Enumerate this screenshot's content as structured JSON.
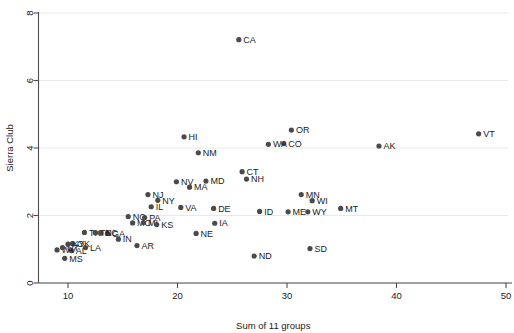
{
  "chart_data": {
    "type": "scatter",
    "title": "",
    "xlabel": "Sum of 11 groups",
    "ylabel": "Sierra Club",
    "xlim": [
      7.6,
      50.5
    ],
    "ylim": [
      -0.35,
      8.3
    ],
    "xticks": [
      10,
      20,
      30,
      40,
      50
    ],
    "yticks": [
      0,
      2,
      4,
      6,
      8
    ],
    "grid": "horizontal",
    "legend": "none",
    "point_label_position": "right",
    "points": [
      {
        "label": "CA",
        "x": 25.6,
        "y": 7.21
      },
      {
        "label": "VT",
        "x": 47.5,
        "y": 4.42
      },
      {
        "label": "HI",
        "x": 20.6,
        "y": 4.33
      },
      {
        "label": "OR",
        "x": 30.4,
        "y": 4.53
      },
      {
        "label": "CO",
        "x": 29.7,
        "y": 4.13
      },
      {
        "label": "WA",
        "x": 28.3,
        "y": 4.11
      },
      {
        "label": "AK",
        "x": 38.4,
        "y": 4.06
      },
      {
        "label": "NM",
        "x": 21.9,
        "y": 3.86
      },
      {
        "label": "CT",
        "x": 25.9,
        "y": 3.3
      },
      {
        "label": "NH",
        "x": 26.3,
        "y": 3.08
      },
      {
        "label": "MD",
        "x": 22.6,
        "y": 3.02
      },
      {
        "label": "NV",
        "x": 19.9,
        "y": 3.0
      },
      {
        "label": "MA",
        "x": 21.1,
        "y": 2.84
      },
      {
        "label": "NJ",
        "x": 17.3,
        "y": 2.62
      },
      {
        "label": "NY",
        "x": 18.2,
        "y": 2.45
      },
      {
        "label": "MN",
        "x": 31.3,
        "y": 2.62
      },
      {
        "label": "WI",
        "x": 32.3,
        "y": 2.44
      },
      {
        "label": "MT",
        "x": 34.9,
        "y": 2.21
      },
      {
        "label": "IL",
        "x": 17.6,
        "y": 2.26
      },
      {
        "label": "VA",
        "x": 20.3,
        "y": 2.24
      },
      {
        "label": "DE",
        "x": 23.3,
        "y": 2.21
      },
      {
        "label": "ID",
        "x": 27.5,
        "y": 2.12
      },
      {
        "label": "ME",
        "x": 30.1,
        "y": 2.11
      },
      {
        "label": "WY",
        "x": 31.9,
        "y": 2.11
      },
      {
        "label": "NC",
        "x": 15.5,
        "y": 1.97
      },
      {
        "label": "PA",
        "x": 17.0,
        "y": 1.94
      },
      {
        "label": "MO",
        "x": 15.9,
        "y": 1.78
      },
      {
        "label": "MI",
        "x": 16.9,
        "y": 1.79
      },
      {
        "label": "KS",
        "x": 18.1,
        "y": 1.73
      },
      {
        "label": "IA",
        "x": 23.4,
        "y": 1.77
      },
      {
        "label": "NE",
        "x": 21.7,
        "y": 1.47
      },
      {
        "label": "TX",
        "x": 11.5,
        "y": 1.5
      },
      {
        "label": "GA",
        "x": 13.6,
        "y": 1.47
      },
      {
        "label": "SC",
        "x": 13.0,
        "y": 1.48
      },
      {
        "label": "TN",
        "x": 12.5,
        "y": 1.49
      },
      {
        "label": "IN",
        "x": 14.6,
        "y": 1.3
      },
      {
        "label": "AR",
        "x": 16.3,
        "y": 1.11
      },
      {
        "label": "OK",
        "x": 10.4,
        "y": 1.17
      },
      {
        "label": "KY",
        "x": 10.0,
        "y": 1.15
      },
      {
        "label": "LA",
        "x": 11.6,
        "y": 1.05
      },
      {
        "label": "AL",
        "x": 10.3,
        "y": 0.96
      },
      {
        "label": "WV",
        "x": 9.0,
        "y": 0.98
      },
      {
        "label": "UT",
        "x": 9.5,
        "y": 1.05
      },
      {
        "label": "ND",
        "x": 27.0,
        "y": 0.8
      },
      {
        "label": "SD",
        "x": 32.1,
        "y": 1.02
      },
      {
        "label": "MS",
        "x": 9.7,
        "y": 0.73
      }
    ]
  }
}
